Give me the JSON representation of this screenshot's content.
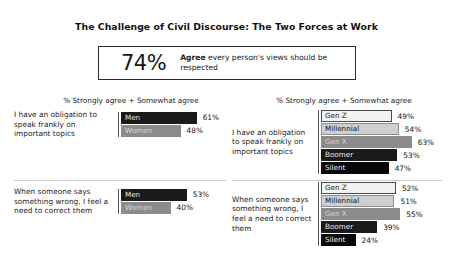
{
  "title": "The Challenge of Civil Discourse: The Two Forces at Work",
  "headline": {
    "number": "74%",
    "emphasis": "Agree",
    "text": " every person's views should be respected"
  },
  "panels": {
    "left": {
      "subhead": "% Strongly agree + Somewhat agree",
      "blocks": [
        {
          "question": "I have an obligation to speak frankly on important topics",
          "bars": [
            {
              "label": "Men",
              "value": "61%",
              "pct": 61,
              "style": "sw-dark"
            },
            {
              "label": "Women",
              "value": "48%",
              "pct": 48,
              "style": "sw-mid"
            }
          ]
        },
        {
          "question": "When someone says something wrong, I feel a need to correct them",
          "bars": [
            {
              "label": "Men",
              "value": "53%",
              "pct": 53,
              "style": "sw-dark"
            },
            {
              "label": "Women",
              "value": "40%",
              "pct": 40,
              "style": "sw-mid"
            }
          ]
        }
      ]
    },
    "right": {
      "subhead": "% Strongly agree + Somewhat agree",
      "blocks": [
        {
          "question": "I have an obligation to speak frankly on important topics",
          "bars": [
            {
              "label": "Gen Z",
              "value": "49%",
              "pct": 49,
              "style": "sw-white"
            },
            {
              "label": "Millennial",
              "value": "54%",
              "pct": 54,
              "style": "sw-light"
            },
            {
              "label": "Gen X",
              "value": "63%",
              "pct": 63,
              "style": "sw-mid"
            },
            {
              "label": "Boomer",
              "value": "53%",
              "pct": 53,
              "style": "sw-dark"
            },
            {
              "label": "Silent",
              "value": "47%",
              "pct": 47,
              "style": "sw-black"
            }
          ]
        },
        {
          "question": "When someone says something wrong, I feel a need to correct them",
          "bars": [
            {
              "label": "Gen Z",
              "value": "52%",
              "pct": 52,
              "style": "sw-white"
            },
            {
              "label": "Millennial",
              "value": "51%",
              "pct": 51,
              "style": "sw-light"
            },
            {
              "label": "Gen X",
              "value": "55%",
              "pct": 55,
              "style": "sw-mid"
            },
            {
              "label": "Boomer",
              "value": "39%",
              "pct": 39,
              "style": "sw-dark"
            },
            {
              "label": "Silent",
              "value": "24%",
              "pct": 24,
              "style": "sw-black"
            }
          ]
        }
      ]
    }
  },
  "chart_data": {
    "type": "bar",
    "title": "The Challenge of Civil Discourse: The Two Forces at Work",
    "xlabel": "% Strongly agree + Somewhat agree",
    "ylabel": "",
    "xlim": [
      0,
      100
    ],
    "grid": false,
    "legend": "inline-bar-labels",
    "orientation": "horizontal",
    "panels": [
      {
        "name": "By gender",
        "subhead": "% Strongly agree + Somewhat agree",
        "groups": [
          {
            "question": "I have an obligation to speak frankly on important topics",
            "categories": [
              "Men",
              "Women"
            ],
            "values": [
              61,
              48
            ]
          },
          {
            "question": "When someone says something wrong, I feel a need to correct them",
            "categories": [
              "Men",
              "Women"
            ],
            "values": [
              53,
              40
            ]
          }
        ]
      },
      {
        "name": "By generation",
        "subhead": "% Strongly agree + Somewhat agree",
        "groups": [
          {
            "question": "I have an obligation to speak frankly on important topics",
            "categories": [
              "Gen Z",
              "Millennial",
              "Gen X",
              "Boomer",
              "Silent"
            ],
            "values": [
              49,
              54,
              63,
              53,
              47
            ]
          },
          {
            "question": "When someone says something wrong, I feel a need to correct them",
            "categories": [
              "Gen Z",
              "Millennial",
              "Gen X",
              "Boomer",
              "Silent"
            ],
            "values": [
              52,
              51,
              55,
              39,
              24
            ]
          }
        ]
      }
    ],
    "annotations": [
      {
        "text": "74% Agree every person's views should be respected",
        "value": 74
      }
    ]
  },
  "scales": {
    "left_px_per_pct": 1.24,
    "right_px_per_pct": 1.44
  }
}
